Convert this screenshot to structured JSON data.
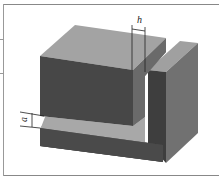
{
  "diagram": {
    "type": "3d-isometric-block",
    "labels": {
      "top_dimension": "h",
      "left_dimension": "a"
    },
    "colors": {
      "top_face": "#a0a0a0",
      "front_face": "#4a4a4a",
      "side_face": "#6e6e6e",
      "frame": "#888888"
    }
  }
}
